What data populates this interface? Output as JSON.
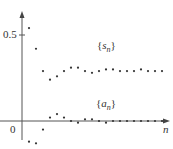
{
  "chart_data": {
    "type": "scatter",
    "title": "",
    "xlabel": "n",
    "ylabel": "",
    "yticks": [
      {
        "value": 0,
        "label": "0"
      },
      {
        "value": 0.5,
        "label": "0.5"
      }
    ],
    "grid": false,
    "series": [
      {
        "name": "{s_n}",
        "label_base": "s",
        "label_sub": "n",
        "x": [
          1,
          2,
          3,
          4,
          5,
          6,
          7,
          8,
          9,
          10,
          11,
          12,
          13,
          14,
          15,
          16,
          17,
          18,
          19,
          20
        ],
        "values": [
          0.54,
          0.42,
          0.29,
          0.24,
          0.26,
          0.29,
          0.31,
          0.31,
          0.29,
          0.28,
          0.29,
          0.3,
          0.3,
          0.29,
          0.29,
          0.29,
          0.3,
          0.29,
          0.29,
          0.29
        ]
      },
      {
        "name": "{a_n}",
        "label_base": "a",
        "label_sub": "n",
        "x": [
          1,
          2,
          3,
          4,
          5,
          6,
          7,
          8,
          9,
          10,
          11,
          12,
          13,
          14,
          15,
          16,
          17,
          18,
          19,
          20
        ],
        "values": [
          -0.12,
          -0.13,
          -0.05,
          0.02,
          0.04,
          0.02,
          0.0,
          -0.01,
          0.01,
          0.01,
          0.0,
          -0.01,
          0.0,
          0.0,
          0.0,
          0.0,
          0.0,
          0.0,
          0.0,
          0.0
        ]
      }
    ],
    "ylim": [
      -0.18,
      0.62
    ],
    "xlim": [
      0,
      22
    ]
  },
  "labels": {
    "tick_half": "0.5",
    "tick_zero": "0",
    "x_axis": "n",
    "s_open": "{",
    "s_base": "s",
    "s_sub": "n",
    "s_close": "}",
    "a_open": "{",
    "a_base": "a",
    "a_sub": "n",
    "a_close": "}"
  }
}
